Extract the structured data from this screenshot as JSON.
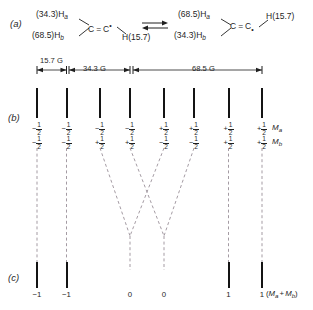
{
  "figure": {
    "panels": [
      {
        "letter": "(a)"
      },
      {
        "letter": "(b)"
      },
      {
        "letter": "(c)"
      }
    ]
  },
  "scheme": {
    "left_structure": {
      "top_label": "(34.3)H",
      "top_sub": "a",
      "bottom_label": "(68.5)H",
      "bottom_sub": "b",
      "left_carbon": "C",
      "bond": "=",
      "right_carbon": "C",
      "radical_dot": "•",
      "right_h": "H(15.7)"
    },
    "equilibrium": "⇌",
    "right_structure": {
      "top_label": "(68.5)H",
      "top_sub": "a",
      "bottom_label": "(34.3)H",
      "bottom_sub": "b",
      "left_carbon": "C",
      "bond": "=",
      "right_carbon": "C",
      "radical_dot": "•",
      "right_h": "H(15.7)"
    }
  },
  "scale_bars": [
    {
      "label": "15.7 G",
      "from_line": 1,
      "to_line": 2
    },
    {
      "label": "34.3 G",
      "from_line": 2,
      "to_line": 4
    },
    {
      "label": "68.5 G",
      "from_line": 4,
      "to_line": 8
    }
  ],
  "chart_data": {
    "type": "bar",
    "xlabel": "",
    "ylabel": "",
    "panel_b": {
      "line_positions": [
        37,
        66.5,
        100,
        130,
        164,
        194,
        228.5,
        262
      ],
      "values": [
        1,
        1,
        1,
        1,
        1,
        1,
        1,
        1
      ],
      "row_labels": [
        "M",
        "M"
      ],
      "row_label_subs": [
        "a",
        "b"
      ],
      "Ma": [
        "-1/2",
        "-1/2",
        "-1/2",
        "-1/2",
        "+1/2",
        "+1/2",
        "+1/2",
        "+1/2"
      ],
      "Mb": [
        "-1/2",
        "-1/2",
        "+1/2",
        "+1/2",
        "-1/2",
        "-1/2",
        "+1/2",
        "+1/2"
      ]
    },
    "panel_c": {
      "line_positions": [
        37,
        66.5,
        130,
        164,
        228.5,
        262
      ],
      "solid": [
        true,
        true,
        false,
        false,
        true,
        true
      ],
      "labels": [
        "-1",
        "-1",
        "0",
        "0",
        "1",
        "1"
      ],
      "sum_label_prefix": "(",
      "sum_label": "M",
      "sum_sub_a": "a",
      "sum_plus": "+",
      "sum_label2": "M",
      "sum_sub_b": "b",
      "sum_label_suffix": ")"
    },
    "collapse_pairs": [
      {
        "from": 100,
        "to": 130,
        "meet_x": 130,
        "meet_y": 236
      },
      {
        "from": 164,
        "to": 130,
        "meet_x": 130,
        "meet_y": 236
      },
      {
        "from": 130,
        "to": 164,
        "meet_x": 164,
        "meet_y": 236
      },
      {
        "from": 194,
        "to": 164,
        "meet_x": 164,
        "meet_y": 236
      }
    ]
  }
}
